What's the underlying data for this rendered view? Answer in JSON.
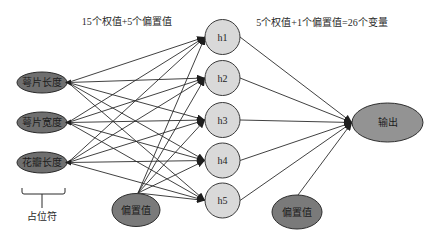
{
  "diagram": {
    "title_left": "15个权值+5个偏置值",
    "title_right": "5个权值+1个偏置值=26个变量",
    "inputs": [
      {
        "id": "x1",
        "label": "萼片长度"
      },
      {
        "id": "x2",
        "label": "萼片宽度"
      },
      {
        "id": "x3",
        "label": "花瓣长度"
      }
    ],
    "input_bracket_label": "占位符",
    "hidden": [
      {
        "id": "h1",
        "label": "h1"
      },
      {
        "id": "h2",
        "label": "h2"
      },
      {
        "id": "h3",
        "label": "h3"
      },
      {
        "id": "h4",
        "label": "h4"
      },
      {
        "id": "h5",
        "label": "h5"
      }
    ],
    "hidden_bias": {
      "id": "b1",
      "label": "偏置值"
    },
    "output": {
      "id": "y",
      "label": "输出"
    },
    "output_bias": {
      "id": "b2",
      "label": "偏置值"
    },
    "edges": [
      [
        "x1",
        "h1"
      ],
      [
        "x1",
        "h2"
      ],
      [
        "x1",
        "h3"
      ],
      [
        "x1",
        "h4"
      ],
      [
        "x1",
        "h5"
      ],
      [
        "x2",
        "h1"
      ],
      [
        "x2",
        "h2"
      ],
      [
        "x2",
        "h3"
      ],
      [
        "x2",
        "h4"
      ],
      [
        "x2",
        "h5"
      ],
      [
        "x3",
        "h1"
      ],
      [
        "x3",
        "h2"
      ],
      [
        "x3",
        "h3"
      ],
      [
        "x3",
        "h4"
      ],
      [
        "x3",
        "h5"
      ],
      [
        "b1",
        "h1"
      ],
      [
        "b1",
        "h2"
      ],
      [
        "b1",
        "h3"
      ],
      [
        "b1",
        "h4"
      ],
      [
        "b1",
        "h5"
      ],
      [
        "h1",
        "y"
      ],
      [
        "h2",
        "y"
      ],
      [
        "h3",
        "y"
      ],
      [
        "h4",
        "y"
      ],
      [
        "h5",
        "y"
      ],
      [
        "b2",
        "y"
      ]
    ]
  }
}
